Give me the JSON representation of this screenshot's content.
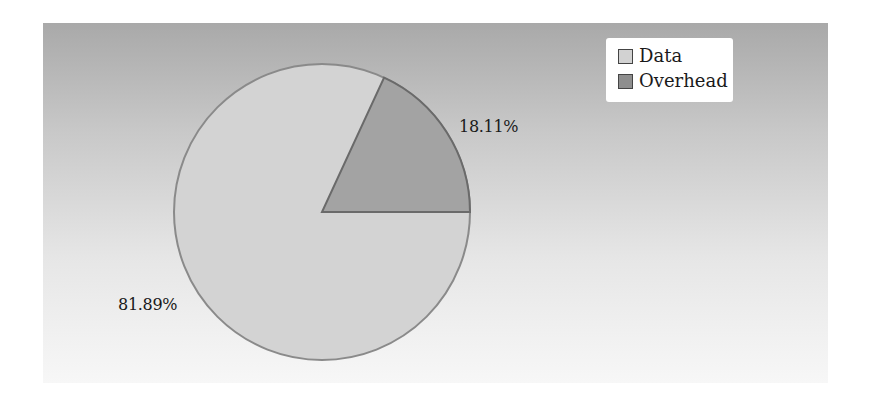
{
  "chart_data": {
    "type": "pie",
    "title": "",
    "categories": [
      "Data",
      "Overhead"
    ],
    "values": [
      81.89,
      18.11
    ],
    "labels": [
      "81.89%",
      "18.11%"
    ],
    "colors": [
      "#d2d2d2",
      "#a2a2a2"
    ],
    "start_angle_deg": 0,
    "direction": "counterclockwise-from-east for Overhead",
    "legend_position": "top-right"
  },
  "legend": {
    "items": [
      {
        "label": "Data",
        "color": "#d2d2d2"
      },
      {
        "label": "Overhead",
        "color": "#a2a2a2"
      }
    ]
  },
  "slice_labels": {
    "data": "81.89%",
    "overhead": "18.11%"
  }
}
